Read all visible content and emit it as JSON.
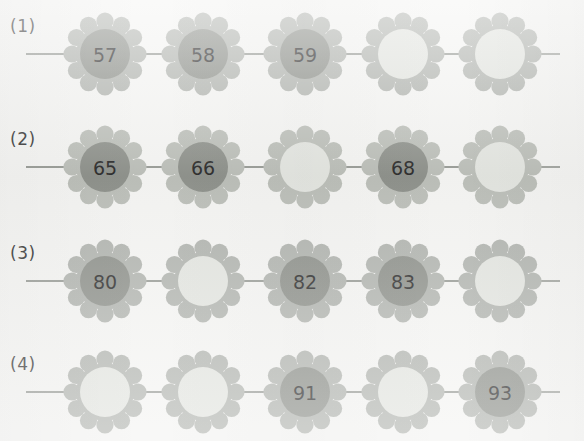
{
  "page": {
    "background_color": "#f4f4f2"
  },
  "style": {
    "petal_color": "#b2b5b0",
    "petal_color_light": "#bcbfb9",
    "center_filled_color": "#8f928c",
    "center_empty_color": "#e3e5e0",
    "stem_color": "#9a9d98",
    "number_color": "#2f2f2f",
    "label_color": "#3b3b3b"
  },
  "rows": [
    {
      "label": "(1)",
      "cells": [
        {
          "value": "57",
          "filled": true
        },
        {
          "value": "58",
          "filled": true
        },
        {
          "value": "59",
          "filled": true
        },
        {
          "value": "",
          "filled": false
        },
        {
          "value": "",
          "filled": false
        }
      ]
    },
    {
      "label": "(2)",
      "cells": [
        {
          "value": "65",
          "filled": true
        },
        {
          "value": "66",
          "filled": true
        },
        {
          "value": "",
          "filled": false
        },
        {
          "value": "68",
          "filled": true
        },
        {
          "value": "",
          "filled": false
        }
      ]
    },
    {
      "label": "(3)",
      "cells": [
        {
          "value": "80",
          "filled": true
        },
        {
          "value": "",
          "filled": false
        },
        {
          "value": "82",
          "filled": true
        },
        {
          "value": "83",
          "filled": true
        },
        {
          "value": "",
          "filled": false
        }
      ]
    },
    {
      "label": "(4)",
      "cells": [
        {
          "value": "",
          "filled": false
        },
        {
          "value": "",
          "filled": false
        },
        {
          "value": "91",
          "filled": true
        },
        {
          "value": "",
          "filled": false
        },
        {
          "value": "93",
          "filled": true
        }
      ]
    }
  ]
}
